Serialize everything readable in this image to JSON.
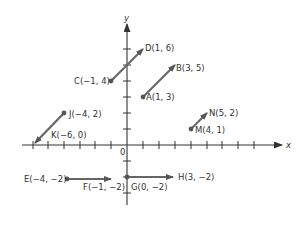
{
  "axes": {
    "x_label": "x",
    "y_label": "y",
    "origin_label": "0"
  },
  "colors": {
    "axis": "#333333",
    "vector": "#666666",
    "point": "#555555",
    "text": "#333333"
  },
  "vectors": [
    {
      "start": {
        "name": "C",
        "label": "C(−1, 4)"
      },
      "end": {
        "name": "D",
        "label": "D(1, 6)"
      }
    },
    {
      "start": {
        "name": "A",
        "label": "A(1, 3)"
      },
      "end": {
        "name": "B",
        "label": "B(3, 5)"
      }
    },
    {
      "start": {
        "name": "J",
        "label": "J(−4, 2)"
      },
      "end": {
        "name": "K",
        "label": "K(−6, 0)"
      }
    },
    {
      "start": {
        "name": "M",
        "label": "M(4, 1)"
      },
      "end": {
        "name": "N",
        "label": "N(5, 2)"
      }
    },
    {
      "start": {
        "name": "E",
        "label": "E(−4, −2)"
      },
      "end": {
        "name": "F",
        "label": "F(−1, −2)"
      }
    },
    {
      "start": {
        "name": "G",
        "label": "G(0, −2)"
      },
      "end": {
        "name": "H",
        "label": "H(3, −2)"
      }
    }
  ],
  "labels": {
    "C": "C(−1, 4)",
    "D": "D(1, 6)",
    "A": "A(1, 3)",
    "B": "B(3, 5)",
    "J": "J(−4, 2)",
    "K": "K(−6, 0)",
    "M": "M(4, 1)",
    "N": "N(5, 2)",
    "E": "E(−4, −2)",
    "F": "F(−1, −2)",
    "G": "G(0, −2)",
    "H": "H(3, −2)"
  }
}
